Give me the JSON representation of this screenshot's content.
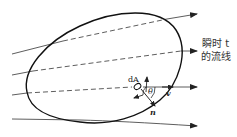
{
  "diagram": {
    "title": "",
    "labels": {
      "area_element": "dA",
      "angle": "θ",
      "velocity": "v",
      "normal": "n",
      "streamline_caption_line1": "瞬时 t",
      "streamline_caption_line2": "的流线"
    },
    "elements": {
      "control_surface": "closed curve (control surface)",
      "streamlines": [
        "streamline-1",
        "streamline-2",
        "streamline-3",
        "streamline-4"
      ]
    },
    "colors": {
      "stroke": "#222222",
      "background": "#ffffff"
    }
  }
}
